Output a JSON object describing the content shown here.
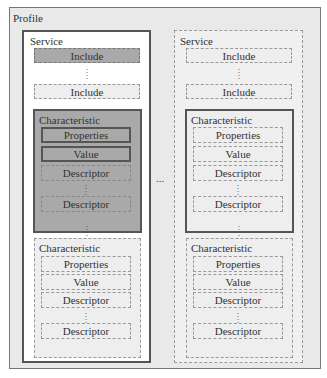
{
  "profile": {
    "label": "Profile"
  },
  "services": [
    {
      "label": "Service",
      "style": "primary",
      "includes": [
        "Include",
        "Include"
      ],
      "characteristics": [
        {
          "label": "Characteristic",
          "properties": "Properties",
          "value": "Value",
          "descriptors": [
            "Descriptor",
            "Descriptor"
          ]
        },
        {
          "label": "Characteristic",
          "properties": "Properties",
          "value": "Value",
          "descriptors": [
            "Descriptor",
            "Descriptor"
          ]
        }
      ]
    },
    {
      "label": "Service",
      "style": "optional",
      "includes": [
        "Include",
        "Include"
      ],
      "characteristics": [
        {
          "label": "Characteristic",
          "properties": "Properties",
          "value": "Value",
          "descriptors": [
            "Descriptor",
            "Descriptor"
          ]
        },
        {
          "label": "Characteristic",
          "properties": "Properties",
          "value": "Value",
          "descriptors": [
            "Descriptor",
            "Descriptor"
          ]
        }
      ]
    }
  ],
  "ellipsis": {
    "vertical": "⋮",
    "horizontal": "..."
  },
  "colors": {
    "profile_bg": "#e9e9e9",
    "highlight_fill": "#a9a9a9",
    "light_fill": "#eeeeee",
    "solid_border": "#555555",
    "dashed_border": "#999999"
  }
}
